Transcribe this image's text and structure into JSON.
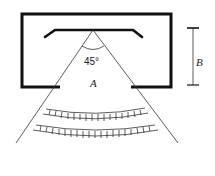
{
  "diagram": {
    "labels": {
      "angle": "45°",
      "region": "A",
      "dimension": "B"
    },
    "colors": {
      "stroke": "#111111",
      "background": "#ffffff"
    },
    "bands": {
      "count": 2,
      "ticks_per_band": 18
    }
  }
}
